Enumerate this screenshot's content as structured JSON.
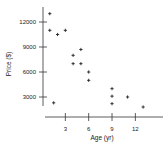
{
  "chart_data": {
    "type": "scatter",
    "title": "",
    "xlabel": "Age (yr)",
    "ylabel": "Price ($)",
    "xlim": [
      0,
      14
    ],
    "ylim": [
      0,
      14000
    ],
    "x_ticks": [
      3,
      6,
      9,
      12
    ],
    "y_ticks": [
      3000,
      6000,
      9000,
      12000
    ],
    "x_tick_labels": [
      "3",
      "6",
      "9",
      "12"
    ],
    "y_tick_labels": [
      "3000",
      "6000",
      "9000",
      "12000"
    ],
    "grid": false,
    "legend": null,
    "marker": "+",
    "points": [
      {
        "x": 1,
        "y": 13000
      },
      {
        "x": 1,
        "y": 11000
      },
      {
        "x": 2,
        "y": 10500
      },
      {
        "x": 3,
        "y": 11000
      },
      {
        "x": 1.5,
        "y": 2300
      },
      {
        "x": 4,
        "y": 8000
      },
      {
        "x": 4,
        "y": 7000
      },
      {
        "x": 5,
        "y": 8700
      },
      {
        "x": 5,
        "y": 7000
      },
      {
        "x": 6,
        "y": 6000
      },
      {
        "x": 6,
        "y": 5000
      },
      {
        "x": 9,
        "y": 4000
      },
      {
        "x": 9,
        "y": 3100
      },
      {
        "x": 9,
        "y": 2200
      },
      {
        "x": 11,
        "y": 3000
      },
      {
        "x": 13,
        "y": 1800
      }
    ]
  },
  "colors": {
    "axis": "#333333",
    "marker": "#222222",
    "background": "#ffffff"
  }
}
